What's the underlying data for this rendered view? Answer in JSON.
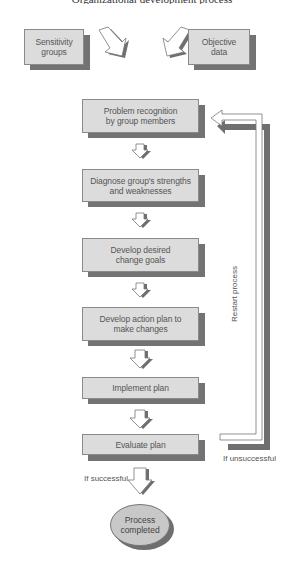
{
  "header": {
    "cutoff_text": "Organizational development process"
  },
  "inputs": [
    {
      "id": "sensitivity-groups",
      "label": "Sensitivity\ngroups",
      "line1": "Sensitivity",
      "line2": "groups"
    },
    {
      "id": "objective-data",
      "label": "Objective\ndata",
      "line1": "Objective",
      "line2": "data"
    }
  ],
  "steps": [
    {
      "id": "problem-recognition",
      "line1": "Problem recognition",
      "line2": "by group members"
    },
    {
      "id": "diagnose",
      "line1": "Diagnose group's strengths",
      "line2": "and weaknesses"
    },
    {
      "id": "develop-goals",
      "line1": "Develop desired",
      "line2": "change goals"
    },
    {
      "id": "develop-action-plan",
      "line1": "Develop action plan to",
      "line2": "make changes"
    },
    {
      "id": "implement-plan",
      "line1": "Implement plan",
      "line2": ""
    },
    {
      "id": "evaluate-plan",
      "line1": "Evaluate plan",
      "line2": ""
    }
  ],
  "terminal": {
    "line1": "Process",
    "line2": "completed"
  },
  "labels": {
    "restart": "Restart process",
    "unsuccessful": "If unsuccessful",
    "successful": "If successful"
  },
  "colors": {
    "box_fill": "#dcdcdc",
    "box_border": "#8a8a8a",
    "shadow": "#737373",
    "ellipse_fill": "#c8c8c8",
    "text": "#555555"
  }
}
